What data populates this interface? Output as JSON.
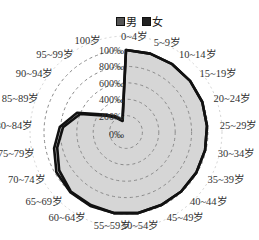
{
  "chart_data": {
    "type": "radar",
    "title": "",
    "legend": {
      "position": "top",
      "entries": [
        "男",
        "女"
      ]
    },
    "categories": [
      "0~4岁",
      "5~9岁",
      "10~14岁",
      "15~19岁",
      "20~24岁",
      "25~29岁",
      "30~34岁",
      "35~39岁",
      "40~44岁",
      "45~49岁",
      "50~54岁",
      "55~59岁",
      "60~64岁",
      "65~69岁",
      "70~74岁",
      "75~79岁",
      "80~84岁",
      "85~89岁",
      "90~94岁",
      "95~99岁",
      "100岁"
    ],
    "radial_ticks": [
      "0‰",
      "200‰",
      "400‰",
      "600‰",
      "800‰",
      "1000‰"
    ],
    "radial_tick_labels_shown": [
      "0‰",
      "200‰",
      "400‰",
      "600‰",
      "800‰",
      "100‰"
    ],
    "rmax": 1000,
    "grid": "dashed concentric circles",
    "series": [
      {
        "name": "男",
        "values": [
          1000,
          1000,
          1000,
          1000,
          1000,
          990,
          990,
          990,
          990,
          990,
          1000,
          1000,
          990,
          990,
          940,
          860,
          770,
          600,
          320,
          210,
          140
        ]
      },
      {
        "name": "女",
        "values": [
          1000,
          1000,
          1000,
          1000,
          1000,
          990,
          990,
          990,
          990,
          990,
          1000,
          1000,
          1000,
          1000,
          980,
          900,
          810,
          640,
          340,
          230,
          150
        ]
      }
    ]
  },
  "legend": {
    "male_label": "男",
    "female_label": "女"
  },
  "colors": {
    "fill": "#d6d6d6",
    "line": "#111111",
    "grid": "#8a8a8a"
  }
}
